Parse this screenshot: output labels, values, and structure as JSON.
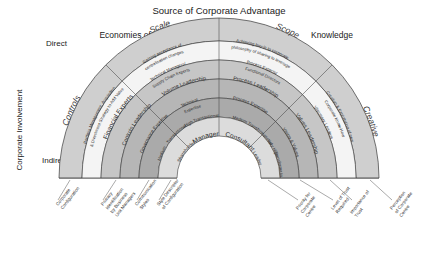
{
  "title": "Source of Corporate Advantage",
  "header": {
    "left": "Economies of Scale",
    "right": "Knowledge"
  },
  "yaxis": {
    "label": "Corporate Involvement",
    "top": "Direct",
    "bottom": "Indirect"
  },
  "colors": {
    "ring_outer": "#cfcfcf",
    "ring_2": "#f2f2f2",
    "ring_3": "#c4c4c4",
    "ring_4": "#b4b4b4",
    "ring_5": "#a8a8a8",
    "ring_inner": "#d8d8d8",
    "stroke": "#3a3a3a",
    "text": "#222222"
  },
  "sectors": [
    {
      "id": "controls",
      "name": "Controls",
      "rings": {
        "outer_title": "Controls",
        "description": "Portfolio Management, Acquisition & Divestment Strategy to Add Value",
        "experts": "Financial Experts",
        "leadership": "Controls Leadership",
        "expertise": "Governance Expertise",
        "transaction": "Medium Transactional",
        "role": "Shareholder"
      }
    },
    {
      "id": "scale",
      "name": "Scale",
      "rings": {
        "outer_title": "Scale",
        "description": "Gaining acceptance of centralisation changes",
        "experts": "Technical Managers/ Supply Chain Experts",
        "leadership": "Volume Leadership",
        "expertise": "Technical Expertise",
        "transaction": "High Transactional",
        "role": "Manager"
      }
    },
    {
      "id": "scope",
      "name": "Scope",
      "rings": {
        "outer_title": "Scope",
        "description": "Achieving buy-in to corporate philosophy of sharing to leverage",
        "experts": "Process Experts/ Functional Directors",
        "leadership": "Process Leadership",
        "expertise": "Process Expertise",
        "transaction": "Medium Transformational",
        "role": "Consultant"
      }
    },
    {
      "id": "creative",
      "name": "Creative",
      "rings": {
        "outer_title": "Creative",
        "description": "Creation & Exploitation of new Corporate Know-How",
        "experts": "Visionary Leaders",
        "leadership": "Values Leadership",
        "expertise": "Vision & Values",
        "transaction": "Very High Transformational",
        "role": "Leader"
      }
    }
  ],
  "bottom_labels": [
    {
      "id": "corporate-configuration",
      "line1": "Corporate",
      "line2": "Configuration",
      "line3": "",
      "line4": ""
    },
    {
      "id": "primary-identification",
      "line1": "Primary",
      "line2": "Identification",
      "line3": "by Business",
      "line4": "Unit Managers"
    },
    {
      "id": "communication-styles",
      "line1": "Communication",
      "line2": "Styles",
      "line3": "",
      "line4": ""
    },
    {
      "id": "style-descriptor",
      "line1": "Style Descriptor",
      "line2": "of Configuration",
      "line3": "",
      "line4": ""
    },
    {
      "id": "priority-corporate-centre",
      "line1": "Priority for",
      "line2": "Corporate",
      "line3": "Centre",
      "line4": ""
    },
    {
      "id": "level-of-trust",
      "line1": "Level of Trust",
      "line2": "Required",
      "line3": "",
      "line4": ""
    },
    {
      "id": "importance-of-trust",
      "line1": "Importance of",
      "line2": "Trust",
      "line3": "",
      "line4": ""
    },
    {
      "id": "perception-corporate-centre",
      "line1": "Perception",
      "line2": "of Corporate",
      "line3": "Centre",
      "line4": ""
    }
  ]
}
